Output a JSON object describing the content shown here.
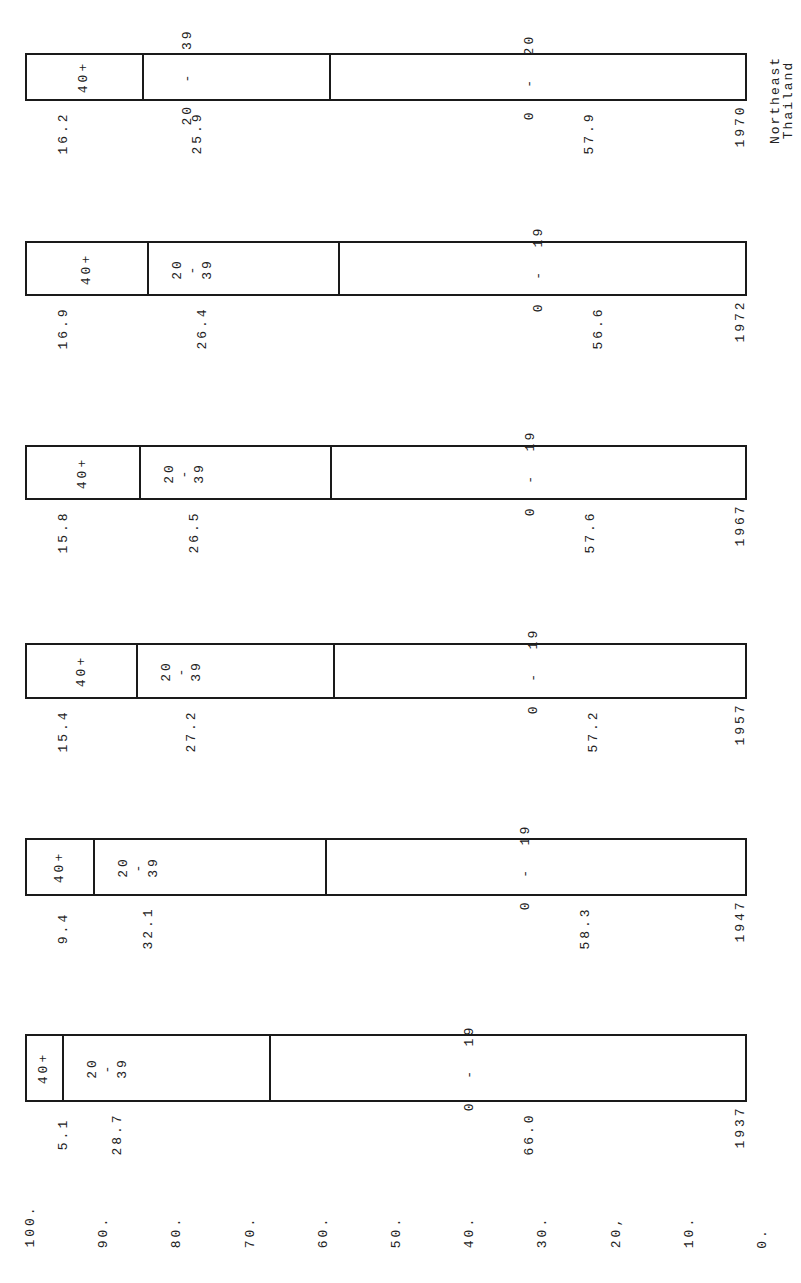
{
  "chart_data": {
    "type": "bar",
    "orientation": "stacked-100-percent, rotated 90deg",
    "title": "Northeast\nThailand",
    "categories": [
      "1937",
      "1947",
      "1957",
      "1967",
      "1972",
      "1970"
    ],
    "series": [
      {
        "name": "40+",
        "values": [
          5.1,
          9.4,
          15.4,
          15.8,
          16.9,
          16.2
        ]
      },
      {
        "name": "20-39",
        "values": [
          28.7,
          32.1,
          27.2,
          26.5,
          26.4,
          25.9
        ]
      },
      {
        "name": "0-19",
        "values": [
          66.0,
          58.3,
          57.2,
          57.6,
          56.6,
          57.9
        ]
      }
    ],
    "segment_labels": {
      "1937": [
        "40+",
        "20\n-\n39",
        "0  -  19"
      ],
      "1947": [
        "40+",
        "20\n-\n39",
        "0  -  19"
      ],
      "1957": [
        "40+",
        "20\n-\n39",
        "0  -  19"
      ],
      "1967": [
        "40+",
        "20\n-\n39",
        "0  -  19"
      ],
      "1972": [
        "40+",
        "20\n-\n39",
        "0  -  19"
      ],
      "1970": [
        "40+",
        "20  -  39",
        "0  -  20"
      ]
    },
    "axis_ticks": [
      "100.",
      "90.",
      "80.",
      "70.",
      "60.",
      "50.",
      "40.",
      "30.",
      "20,",
      "10.",
      "0."
    ],
    "ylim": [
      0,
      100
    ],
    "xlabel": "",
    "ylabel": "",
    "grid": false,
    "legend": "none (segment labels inside bars)"
  },
  "bars": [
    {
      "year": "1970",
      "top": 53,
      "height": 48,
      "segs": [
        16.2,
        25.9,
        57.9
      ],
      "labels": [
        "40+",
        "20  -  39",
        "0  -  20"
      ],
      "vals": [
        "16.2",
        "25.9",
        "57.9"
      ]
    },
    {
      "year": "1972",
      "top": 241,
      "height": 55,
      "segs": [
        16.9,
        26.4,
        56.6
      ],
      "labels": [
        "40+",
        "20\n-\n39",
        "0  -  19"
      ],
      "vals": [
        "16.9",
        "26.4",
        "56.6"
      ]
    },
    {
      "year": "1967",
      "top": 445,
      "height": 55,
      "segs": [
        15.8,
        26.5,
        57.6
      ],
      "labels": [
        "40+",
        "20\n-\n39",
        "0  -  19"
      ],
      "vals": [
        "15.8",
        "26.5",
        "57.6"
      ]
    },
    {
      "year": "1957",
      "top": 643,
      "height": 56,
      "segs": [
        15.4,
        27.2,
        57.2
      ],
      "labels": [
        "40+",
        "20\n-\n39",
        "0  -  19"
      ],
      "vals": [
        "15.4",
        "27.2",
        "57.2"
      ]
    },
    {
      "year": "1947",
      "top": 838,
      "height": 58,
      "segs": [
        9.4,
        32.1,
        58.3
      ],
      "labels": [
        "40+",
        "20\n-\n39",
        "0  -  19"
      ],
      "vals": [
        "9.4",
        "32.1",
        "58.3"
      ]
    },
    {
      "year": "1937",
      "top": 1034,
      "height": 68,
      "segs": [
        5.1,
        28.7,
        66.0
      ],
      "labels": [
        "40+",
        "20\n-\n39",
        "0  -  19"
      ],
      "vals": [
        "5.1",
        "28.7",
        "66.0"
      ]
    }
  ]
}
